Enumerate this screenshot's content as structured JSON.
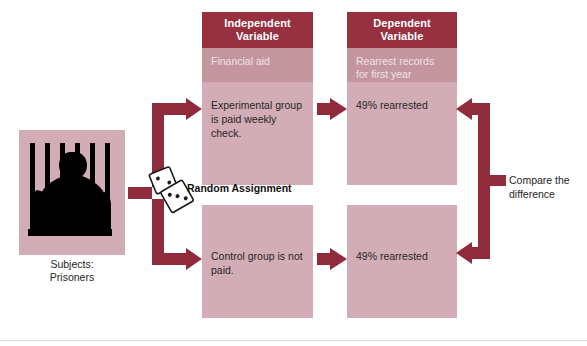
{
  "figure": {
    "title_visible": false,
    "colors": {
      "header_dark": "#97303f",
      "band_medium": "#c3959e",
      "cell_light": "#d3adb6",
      "arrow": "#8f2b3a",
      "text_dark": "#262626",
      "text_on_dark": "#ffffff",
      "background": "#ffffff"
    }
  },
  "subjects": {
    "caption_line1": "Subjects:",
    "caption_line2": "Prisoners",
    "image_alt": "prisoner-silhouette-behind-bars"
  },
  "random_assignment": {
    "label": "Random Assignment",
    "icon": "two-dice-icon"
  },
  "columns": [
    {
      "id": "independent-variable",
      "header_line1": "Independent",
      "header_line2": "Variable",
      "subheader": "Financial aid",
      "cells": [
        {
          "id": "experimental-group",
          "text": "Experimental group is paid weekly check."
        },
        {
          "id": "control-group",
          "text": "Control group is not paid."
        }
      ]
    },
    {
      "id": "dependent-variable",
      "header_line1": "Dependent",
      "header_line2": "Variable",
      "subheader_line1": "Rearrest records",
      "subheader_line2": "for first year",
      "cells": [
        {
          "id": "experimental-outcome",
          "text": "49% rearrested"
        },
        {
          "id": "control-outcome",
          "text": "49% rearrested"
        }
      ]
    }
  ],
  "compare": {
    "label_line1": "Compare the",
    "label_line2": "difference"
  },
  "arrows": [
    {
      "id": "subjects-to-split",
      "direction": "right"
    },
    {
      "id": "split-to-experimental",
      "direction": "up-right-elbow"
    },
    {
      "id": "split-to-control",
      "direction": "down-right-elbow"
    },
    {
      "id": "experimental-iv-to-dv",
      "direction": "right"
    },
    {
      "id": "control-iv-to-dv",
      "direction": "right"
    },
    {
      "id": "compare-bracket",
      "direction": "left-double"
    }
  ]
}
